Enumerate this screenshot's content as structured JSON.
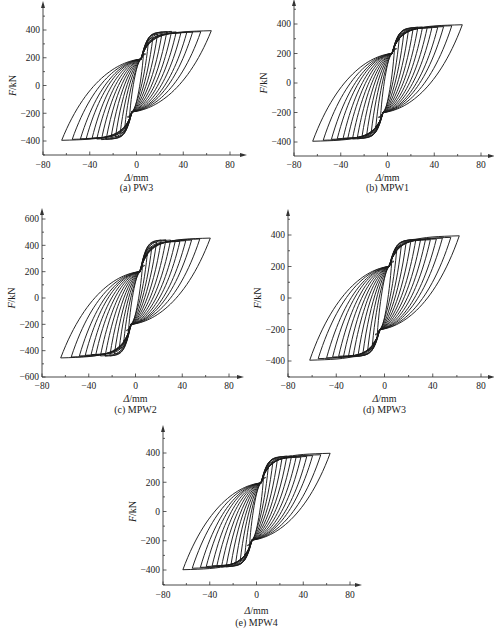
{
  "chart_data": [
    {
      "type": "line",
      "id": "a",
      "caption": "(a) PW3",
      "specimen": "PW3",
      "xlabel_italic": "Δ",
      "xlabel_unit": "/mm",
      "ylabel_italic": "F",
      "ylabel_unit": "/kN",
      "xlim": [
        -80,
        85
      ],
      "ylim": [
        -500,
        560
      ],
      "xticks": [
        -80,
        -40,
        0,
        40,
        80
      ],
      "yticks": [
        -400,
        -200,
        0,
        200,
        400
      ],
      "grid": false,
      "pinch_force": 190,
      "cycles": {
        "amplitude_mm": [
          6,
          10,
          14,
          18,
          22,
          26,
          30,
          34,
          38,
          43,
          48,
          55,
          64
        ],
        "peak_force_kN": [
          230,
          300,
          345,
          372,
          385,
          388,
          390,
          386,
          380,
          382,
          385,
          388,
          395
        ]
      }
    },
    {
      "type": "line",
      "id": "b",
      "caption": "(b) MPW1",
      "specimen": "MPW1",
      "xlabel_italic": "Δ",
      "xlabel_unit": "/mm",
      "ylabel_italic": "F",
      "ylabel_unit": "/kN",
      "xlim": [
        -80,
        85
      ],
      "ylim": [
        -500,
        560
      ],
      "xticks": [
        -80,
        -40,
        0,
        40,
        80
      ],
      "yticks": [
        -400,
        -200,
        0,
        200,
        400
      ],
      "grid": false,
      "pinch_force": 200,
      "cycles": {
        "amplitude_mm": [
          6,
          10,
          14,
          18,
          22,
          26,
          30,
          34,
          38,
          43,
          48,
          55,
          64
        ],
        "peak_force_kN": [
          235,
          300,
          340,
          362,
          372,
          378,
          380,
          376,
          375,
          378,
          382,
          388,
          395
        ]
      }
    },
    {
      "type": "line",
      "id": "c",
      "caption": "(c) MPW2",
      "specimen": "MPW2",
      "xlabel_italic": "Δ",
      "xlabel_unit": "/mm",
      "ylabel_italic": "F",
      "ylabel_unit": "/kN",
      "xlim": [
        -80,
        85
      ],
      "ylim": [
        -600,
        620
      ],
      "xticks": [
        -80,
        -40,
        0,
        40,
        80
      ],
      "yticks": [
        -600,
        -400,
        -200,
        0,
        200,
        400,
        600
      ],
      "grid": false,
      "pinch_force": 200,
      "cycles": {
        "amplitude_mm": [
          6,
          10,
          14,
          18,
          22,
          26,
          30,
          34,
          38,
          43,
          48,
          55,
          64
        ],
        "peak_force_kN": [
          250,
          330,
          390,
          425,
          440,
          442,
          440,
          432,
          430,
          435,
          440,
          448,
          455
        ]
      }
    },
    {
      "type": "line",
      "id": "d",
      "caption": "(d) MPW3",
      "specimen": "MPW3",
      "xlabel_italic": "Δ",
      "xlabel_unit": "/mm",
      "ylabel_italic": "F",
      "ylabel_unit": "/kN",
      "xlim": [
        -80,
        85
      ],
      "ylim": [
        -500,
        560
      ],
      "xticks": [
        -80,
        -40,
        0,
        40,
        80
      ],
      "yticks": [
        -400,
        -200,
        0,
        200,
        400
      ],
      "grid": false,
      "pinch_force": 200,
      "cycles": {
        "amplitude_mm": [
          6,
          10,
          14,
          18,
          22,
          26,
          30,
          34,
          38,
          43,
          48,
          55,
          62
        ],
        "peak_force_kN": [
          235,
          295,
          335,
          358,
          368,
          372,
          375,
          372,
          370,
          375,
          380,
          385,
          395
        ]
      }
    },
    {
      "type": "line",
      "id": "e",
      "caption": "(e) MPW4",
      "specimen": "MPW4",
      "xlabel_italic": "Δ",
      "xlabel_unit": "/mm",
      "ylabel_italic": "F",
      "ylabel_unit": "/kN",
      "xlim": [
        -80,
        85
      ],
      "ylim": [
        -500,
        560
      ],
      "xticks": [
        -80,
        -40,
        0,
        40,
        80
      ],
      "yticks": [
        -400,
        -200,
        0,
        200,
        400
      ],
      "grid": false,
      "pinch_force": 195,
      "cycles": {
        "amplitude_mm": [
          6,
          10,
          14,
          18,
          22,
          26,
          30,
          34,
          38,
          43,
          48,
          55,
          63
        ],
        "peak_force_kN": [
          235,
          300,
          340,
          362,
          372,
          378,
          380,
          375,
          372,
          376,
          382,
          388,
          398
        ]
      }
    }
  ]
}
